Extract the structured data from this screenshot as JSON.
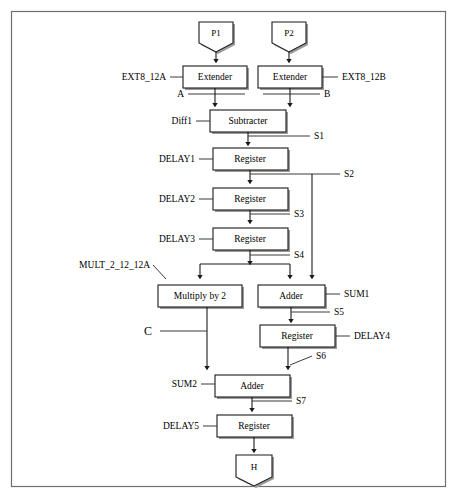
{
  "diagram": {
    "frame": {
      "border_color": "#6f6f6f",
      "background": "#ffffff"
    },
    "inputs": [
      {
        "id": "p1",
        "label": "P1"
      },
      {
        "id": "p2",
        "label": "P2"
      }
    ],
    "output": {
      "id": "h",
      "label": "H"
    },
    "blocks": [
      {
        "id": "extender_a",
        "label": "Extender"
      },
      {
        "id": "extender_b",
        "label": "Extender"
      },
      {
        "id": "subtracter",
        "label": "Subtracter"
      },
      {
        "id": "register_1",
        "label": "Register"
      },
      {
        "id": "register_2",
        "label": "Register"
      },
      {
        "id": "register_3",
        "label": "Register"
      },
      {
        "id": "multiply_by_2",
        "label": "Multiply by 2"
      },
      {
        "id": "adder_1",
        "label": "Adder"
      },
      {
        "id": "register_4",
        "label": "Register"
      },
      {
        "id": "adder_2",
        "label": "Adder"
      },
      {
        "id": "register_5",
        "label": "Register"
      }
    ],
    "side_labels": [
      {
        "id": "ext8_12a",
        "label": "EXT8_12A",
        "side": "left"
      },
      {
        "id": "ext8_12b",
        "label": "EXT8_12B",
        "side": "right"
      },
      {
        "id": "input_a",
        "label": "A",
        "side": "left"
      },
      {
        "id": "input_b",
        "label": "B",
        "side": "right"
      },
      {
        "id": "diff1",
        "label": "Diff1",
        "side": "left"
      },
      {
        "id": "delay1",
        "label": "DELAY1",
        "side": "left"
      },
      {
        "id": "delay2",
        "label": "DELAY2",
        "side": "left"
      },
      {
        "id": "delay3",
        "label": "DELAY3",
        "side": "left"
      },
      {
        "id": "mult_2_12_12a",
        "label": "MULT_2_12_12A",
        "side": "left"
      },
      {
        "id": "signal_c",
        "label": "C",
        "side": "left"
      },
      {
        "id": "sum2",
        "label": "SUM2",
        "side": "left"
      },
      {
        "id": "delay5",
        "label": "DELAY5",
        "side": "left"
      },
      {
        "id": "sum1",
        "label": "SUM1",
        "side": "right"
      },
      {
        "id": "delay4",
        "label": "DELAY4",
        "side": "right"
      }
    ],
    "signals": [
      {
        "id": "s1",
        "label": "S1"
      },
      {
        "id": "s2",
        "label": "S2"
      },
      {
        "id": "s3",
        "label": "S3"
      },
      {
        "id": "s4",
        "label": "S4"
      },
      {
        "id": "s5",
        "label": "S5"
      },
      {
        "id": "s6",
        "label": "S6"
      },
      {
        "id": "s7",
        "label": "S7"
      }
    ]
  }
}
